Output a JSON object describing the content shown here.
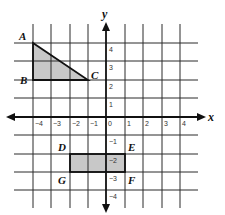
{
  "diagram": {
    "type": "coordinate-grid",
    "axes": {
      "x_label": "x",
      "y_label": "y"
    },
    "x_ticks": [
      "-4",
      "-3",
      "-2",
      "-1",
      "0",
      "1",
      "2",
      "3",
      "4"
    ],
    "y_ticks": [
      "4",
      "3",
      "2",
      "1",
      "-1",
      "-2",
      "-3",
      "-4"
    ],
    "range": {
      "x": [
        -4,
        4
      ],
      "y": [
        -4,
        4
      ]
    },
    "shapes": [
      {
        "name": "triangle-ABC",
        "fill": "#c8c8c8",
        "vertices": [
          {
            "label": "A",
            "x": -4,
            "y": 4
          },
          {
            "label": "B",
            "x": -4,
            "y": 2
          },
          {
            "label": "C",
            "x": -1,
            "y": 2
          }
        ]
      },
      {
        "name": "rectangle-DEFG",
        "fill": "#c8c8c8",
        "vertices": [
          {
            "label": "D",
            "x": -2,
            "y": -2
          },
          {
            "label": "E",
            "x": 1,
            "y": -2
          },
          {
            "label": "F",
            "x": 1,
            "y": -3
          },
          {
            "label": "G",
            "x": -2,
            "y": -3
          }
        ]
      }
    ],
    "point_labels": {
      "A": "A",
      "B": "B",
      "C": "C",
      "D": "D",
      "E": "E",
      "F": "F",
      "G": "G"
    },
    "tick_labels": {
      "xn4": "−4",
      "xn3": "−3",
      "xn2": "−2",
      "xn1": "−1",
      "x0": "0",
      "x1": "1",
      "x2": "2",
      "x3": "3",
      "x4": "4",
      "y4": "4",
      "y3": "3",
      "y2": "2",
      "y1": "1",
      "yn1": "−1",
      "yn2": "−2",
      "yn3": "−3",
      "yn4": "−4"
    }
  }
}
